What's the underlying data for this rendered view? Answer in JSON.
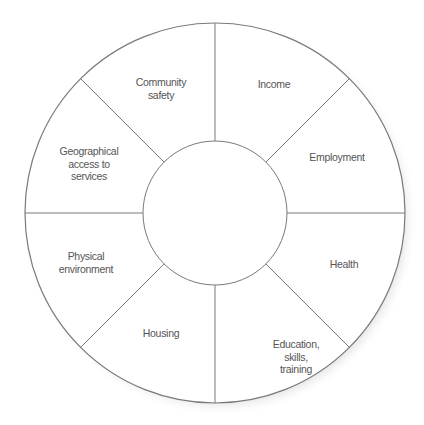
{
  "diagram": {
    "type": "wheel",
    "center": [
      215,
      213
    ],
    "outer_radius": 190,
    "inner_radius": 72,
    "colors": {
      "line": "#7a7a7a",
      "text": "#555555",
      "fill": "#ffffff",
      "shadow": "#d8d8d8"
    },
    "segments": [
      {
        "id": "income",
        "lines": [
          "Income"
        ],
        "pos": [
          274,
          84
        ]
      },
      {
        "id": "employment",
        "lines": [
          "Employment"
        ],
        "pos": [
          337,
          157
        ]
      },
      {
        "id": "health",
        "lines": [
          "Health"
        ],
        "pos": [
          344,
          264
        ]
      },
      {
        "id": "education",
        "lines": [
          "Education,",
          "skills,",
          "training"
        ],
        "pos": [
          296,
          357
        ]
      },
      {
        "id": "housing",
        "lines": [
          "Housing"
        ],
        "pos": [
          161,
          333
        ]
      },
      {
        "id": "physical-environment",
        "lines": [
          "Physical",
          "environment"
        ],
        "pos": [
          86,
          262
        ]
      },
      {
        "id": "geographical-access",
        "lines": [
          "Geographical",
          "access to",
          "services"
        ],
        "pos": [
          89,
          164
        ]
      },
      {
        "id": "community-safety",
        "lines": [
          "Community",
          "safety"
        ],
        "pos": [
          161,
          88
        ]
      }
    ]
  }
}
